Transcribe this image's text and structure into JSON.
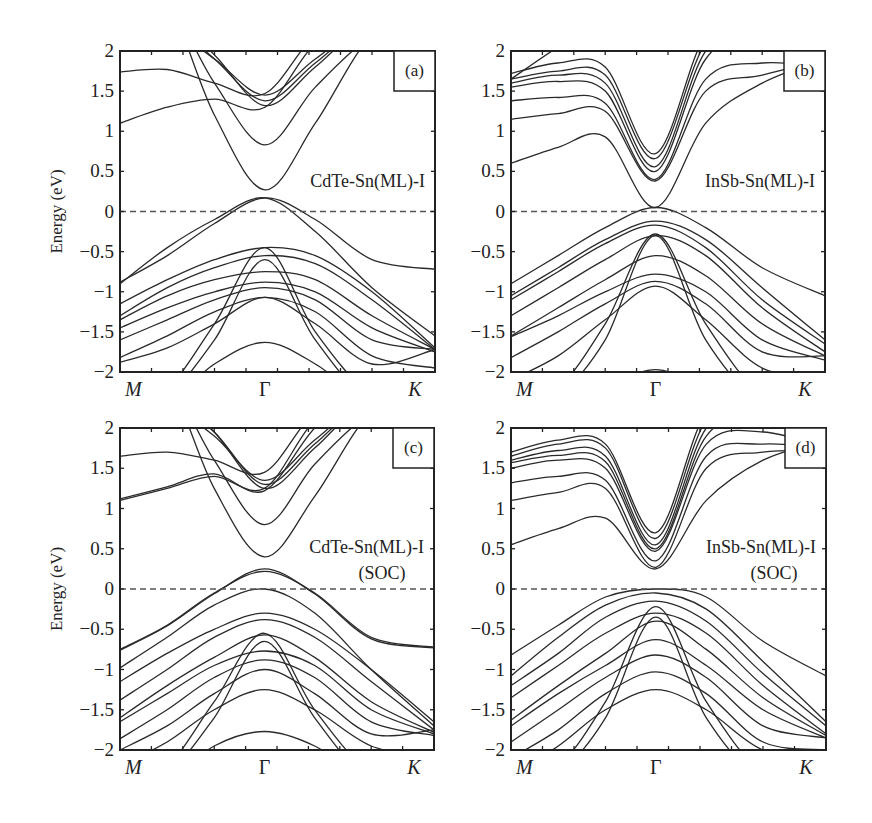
{
  "chart_data": [
    {
      "id": "a",
      "type": "line",
      "panel_label": "(a)",
      "title": "CdTe-Sn(ML)-I",
      "subtitle": "",
      "ylabel": "Energy (eV)",
      "xlabel": "",
      "x_ticks": [
        "M",
        "Γ",
        "K"
      ],
      "x_tick_positions": [
        0,
        0.46,
        1
      ],
      "ylim": [
        -2,
        2
      ],
      "y_ticks": [
        "2",
        "1.5",
        "1",
        "0.5",
        "0",
        "−0.5",
        "−1",
        "−1.5",
        "−2"
      ],
      "fermi_level": 0,
      "grid": false,
      "k_samples": [
        0,
        0.15,
        0.3,
        0.46,
        0.62,
        0.8,
        1.0
      ],
      "bands": [
        [
          1.74,
          1.77,
          1.6,
          1.47,
          2.2,
          2.6,
          2.8
        ],
        [
          1.1,
          1.3,
          1.4,
          1.3,
          2.1,
          2.6,
          2.8
        ],
        [
          2.4,
          2.3,
          1.9,
          1.45,
          1.9,
          2.4,
          2.6
        ],
        [
          2.5,
          2.4,
          1.9,
          1.38,
          1.85,
          2.4,
          2.6
        ],
        [
          2.6,
          2.5,
          1.95,
          1.32,
          1.8,
          2.4,
          2.6
        ],
        [
          2.7,
          2.6,
          1.6,
          0.83,
          1.55,
          2.2,
          2.6
        ],
        [
          2.8,
          2.6,
          1.2,
          0.27,
          1.1,
          2.2,
          2.6
        ],
        [
          -0.88,
          -0.55,
          -0.15,
          0.17,
          -0.1,
          -0.6,
          -0.72
        ],
        [
          -0.9,
          -0.45,
          -0.1,
          0.17,
          -0.25,
          -0.95,
          -1.55
        ],
        [
          -1.15,
          -0.85,
          -0.6,
          -0.45,
          -0.55,
          -1.0,
          -1.7
        ],
        [
          -1.3,
          -0.95,
          -0.7,
          -0.55,
          -0.65,
          -1.1,
          -1.72
        ],
        [
          -1.35,
          -1.05,
          -0.85,
          -0.75,
          -0.85,
          -1.3,
          -1.72
        ],
        [
          -1.45,
          -1.2,
          -1.0,
          -0.88,
          -1.0,
          -1.45,
          -1.75
        ],
        [
          -1.6,
          -1.35,
          -1.1,
          -0.95,
          -1.1,
          -1.6,
          -1.72
        ],
        [
          -1.82,
          -1.55,
          -1.25,
          -1.07,
          -1.25,
          -1.8,
          -1.95
        ],
        [
          -1.88,
          -1.7,
          -1.4,
          -1.07,
          -1.4,
          -1.9,
          -1.72
        ],
        [
          -2.4,
          -2.2,
          -1.4,
          -0.45,
          -1.5,
          -2.3,
          -2.6
        ],
        [
          -2.5,
          -2.3,
          -1.6,
          -0.6,
          -1.6,
          -2.4,
          -2.6
        ],
        [
          -2.6,
          -2.4,
          -1.9,
          -1.63,
          -1.9,
          -2.4,
          -2.6
        ]
      ]
    },
    {
      "id": "b",
      "type": "line",
      "panel_label": "(b)",
      "title": "InSb-Sn(ML)-I",
      "subtitle": "",
      "ylabel": "",
      "xlabel": "",
      "x_ticks": [
        "M",
        "Γ",
        "K"
      ],
      "x_tick_positions": [
        0,
        0.46,
        1
      ],
      "ylim": [
        -2,
        2
      ],
      "y_ticks": [
        "2",
        "1.5",
        "1",
        "0.5",
        "0",
        "−0.5",
        "−1",
        "−1.5",
        "−2"
      ],
      "fermi_level": 0,
      "grid": false,
      "k_samples": [
        0,
        0.15,
        0.3,
        0.46,
        0.62,
        0.8,
        1.0
      ],
      "bands": [
        [
          1.72,
          1.85,
          1.8,
          0.72,
          2.2,
          2.6,
          2.8
        ],
        [
          1.65,
          1.75,
          1.7,
          0.66,
          2.1,
          2.5,
          2.8
        ],
        [
          1.6,
          1.7,
          1.6,
          0.56,
          2.0,
          2.4,
          1.9
        ],
        [
          1.55,
          1.62,
          1.5,
          0.5,
          1.9,
          2.3,
          1.82
        ],
        [
          1.38,
          1.42,
          1.35,
          0.4,
          1.65,
          1.85,
          1.8
        ],
        [
          1.15,
          1.22,
          1.25,
          0.38,
          1.5,
          1.7,
          1.9
        ],
        [
          0.6,
          0.8,
          0.93,
          0.05,
          1.1,
          1.6,
          1.9
        ],
        [
          1.65,
          2.05,
          2.4,
          2.6,
          2.6,
          2.6,
          2.6
        ],
        [
          -0.9,
          -0.55,
          -0.2,
          0.05,
          -0.2,
          -0.7,
          -1.05
        ],
        [
          -1.05,
          -0.7,
          -0.35,
          -0.12,
          -0.35,
          -0.95,
          -1.6
        ],
        [
          -1.1,
          -0.75,
          -0.4,
          -0.17,
          -0.45,
          -1.1,
          -1.65
        ],
        [
          -1.3,
          -0.95,
          -0.6,
          -0.3,
          -0.55,
          -1.2,
          -1.75
        ],
        [
          -1.55,
          -1.2,
          -0.85,
          -0.55,
          -0.8,
          -1.4,
          -1.8
        ],
        [
          -1.56,
          -1.3,
          -1.0,
          -0.78,
          -1.0,
          -1.6,
          -1.85
        ],
        [
          -1.82,
          -1.5,
          -1.15,
          -0.87,
          -1.15,
          -1.75,
          -1.8
        ],
        [
          -2.1,
          -1.8,
          -1.35,
          -0.93,
          -1.35,
          -1.95,
          -2.1
        ],
        [
          -2.4,
          -2.2,
          -1.4,
          -0.28,
          -1.4,
          -2.3,
          -2.6
        ],
        [
          -2.5,
          -2.3,
          -1.6,
          -0.3,
          -1.6,
          -2.4,
          -2.6
        ],
        [
          -2.6,
          -2.5,
          -2.2,
          -1.97,
          -2.2,
          -2.5,
          -2.6
        ]
      ]
    },
    {
      "id": "c",
      "type": "line",
      "panel_label": "(c)",
      "title": "CdTe-Sn(ML)-I",
      "subtitle": "(SOC)",
      "ylabel": "Energy (eV)",
      "xlabel": "",
      "x_ticks": [
        "M",
        "Γ",
        "K"
      ],
      "x_tick_positions": [
        0,
        0.46,
        1
      ],
      "ylim": [
        -2,
        2
      ],
      "y_ticks": [
        "2",
        "1.5",
        "1",
        "0.5",
        "0",
        "−0.5",
        "−1",
        "−1.5",
        "−2"
      ],
      "fermi_level": 0,
      "grid": false,
      "k_samples": [
        0,
        0.15,
        0.3,
        0.46,
        0.62,
        0.8,
        1.0
      ],
      "bands": [
        [
          1.65,
          1.7,
          1.6,
          1.45,
          2.2,
          2.6,
          2.8
        ],
        [
          1.1,
          1.25,
          1.4,
          1.25,
          2.1,
          2.6,
          2.8
        ],
        [
          1.12,
          1.27,
          1.43,
          1.22,
          2.0,
          2.6,
          2.8
        ],
        [
          2.4,
          2.3,
          1.9,
          1.35,
          1.85,
          2.4,
          2.6
        ],
        [
          2.5,
          2.4,
          1.95,
          1.3,
          1.8,
          2.4,
          2.6
        ],
        [
          2.6,
          2.5,
          1.95,
          1.25,
          1.75,
          2.4,
          2.6
        ],
        [
          2.7,
          2.6,
          1.6,
          0.8,
          1.55,
          2.2,
          2.6
        ],
        [
          2.8,
          2.6,
          1.25,
          0.4,
          1.15,
          2.2,
          2.6
        ],
        [
          -0.75,
          -0.45,
          -0.05,
          0.22,
          -0.05,
          -0.6,
          -0.72
        ],
        [
          -0.76,
          -0.46,
          -0.06,
          0.25,
          -0.06,
          -0.62,
          -0.73
        ],
        [
          -0.98,
          -0.6,
          -0.2,
          0.0,
          -0.3,
          -1.0,
          -1.7
        ],
        [
          -1.15,
          -0.8,
          -0.5,
          -0.3,
          -0.5,
          -1.0,
          -1.65
        ],
        [
          -1.38,
          -1.0,
          -0.6,
          -0.38,
          -0.6,
          -1.15,
          -1.75
        ],
        [
          -1.6,
          -1.2,
          -0.85,
          -0.57,
          -0.85,
          -1.4,
          -1.78
        ],
        [
          -1.65,
          -1.3,
          -0.95,
          -0.77,
          -0.95,
          -1.5,
          -1.8
        ],
        [
          -1.86,
          -1.5,
          -1.1,
          -0.88,
          -1.1,
          -1.65,
          -1.82
        ],
        [
          -2.0,
          -1.7,
          -1.3,
          -1.0,
          -1.3,
          -1.8,
          -1.75
        ],
        [
          -2.2,
          -1.9,
          -1.5,
          -1.25,
          -1.5,
          -1.95,
          -2.1
        ],
        [
          -2.4,
          -2.2,
          -1.4,
          -0.55,
          -1.5,
          -2.3,
          -2.6
        ],
        [
          -2.5,
          -2.3,
          -1.6,
          -0.65,
          -1.6,
          -2.4,
          -2.6
        ],
        [
          -2.6,
          -2.4,
          -1.95,
          -1.77,
          -1.95,
          -2.4,
          -2.6
        ]
      ]
    },
    {
      "id": "d",
      "type": "line",
      "panel_label": "(d)",
      "title": "InSb-Sn(ML)-I",
      "subtitle": "(SOC)",
      "ylabel": "",
      "xlabel": "",
      "x_ticks": [
        "M",
        "Γ",
        "K"
      ],
      "x_tick_positions": [
        0,
        0.46,
        1
      ],
      "ylim": [
        -2,
        2
      ],
      "y_ticks": [
        "2",
        "1.5",
        "1",
        "0.5",
        "0",
        "−0.5",
        "−1",
        "−1.5",
        "−2"
      ],
      "fermi_level": 0,
      "grid": false,
      "k_samples": [
        0,
        0.15,
        0.3,
        0.46,
        0.62,
        0.8,
        1.0
      ],
      "bands": [
        [
          1.7,
          1.85,
          1.8,
          0.7,
          2.2,
          2.6,
          2.8
        ],
        [
          1.65,
          1.8,
          1.75,
          0.63,
          2.1,
          2.5,
          2.8
        ],
        [
          1.6,
          1.72,
          1.65,
          0.55,
          2.0,
          2.4,
          1.85
        ],
        [
          1.57,
          1.66,
          1.58,
          0.5,
          1.9,
          2.2,
          1.8
        ],
        [
          1.5,
          1.6,
          1.5,
          0.47,
          1.8,
          1.95,
          1.75
        ],
        [
          1.32,
          1.4,
          1.35,
          0.35,
          1.65,
          1.8,
          1.75
        ],
        [
          1.1,
          1.2,
          1.25,
          0.27,
          1.5,
          1.7,
          1.72
        ],
        [
          0.55,
          0.75,
          0.88,
          0.25,
          1.1,
          1.6,
          1.85
        ],
        [
          -0.82,
          -0.45,
          -0.1,
          0.0,
          -0.1,
          -0.65,
          -1.08
        ],
        [
          -1.08,
          -0.6,
          -0.2,
          -0.05,
          -0.25,
          -0.9,
          -1.65
        ],
        [
          -1.2,
          -0.8,
          -0.35,
          -0.15,
          -0.4,
          -1.05,
          -1.7
        ],
        [
          -1.35,
          -0.95,
          -0.55,
          -0.3,
          -0.55,
          -1.2,
          -1.8
        ],
        [
          -1.63,
          -1.2,
          -0.8,
          -0.4,
          -0.75,
          -1.35,
          -1.82
        ],
        [
          -1.7,
          -1.3,
          -0.95,
          -0.63,
          -0.95,
          -1.5,
          -1.85
        ],
        [
          -1.9,
          -1.5,
          -1.1,
          -0.82,
          -1.1,
          -1.7,
          -1.85
        ],
        [
          -2.1,
          -1.75,
          -1.3,
          -1.03,
          -1.3,
          -1.9,
          -2.0
        ],
        [
          -2.3,
          -1.95,
          -1.5,
          -1.25,
          -1.5,
          -2.0,
          -2.1
        ],
        [
          -2.4,
          -2.2,
          -1.4,
          -0.22,
          -1.4,
          -2.3,
          -2.6
        ],
        [
          -2.5,
          -2.3,
          -1.6,
          -0.35,
          -1.6,
          -2.4,
          -2.6
        ]
      ]
    }
  ]
}
